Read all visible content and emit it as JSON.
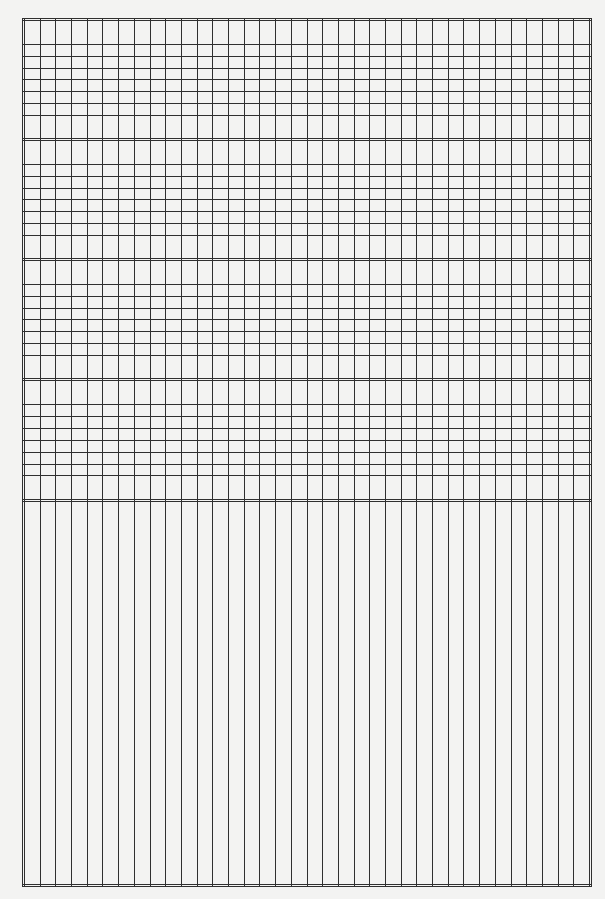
{
  "page": {
    "type": "semi-log graph paper",
    "background_color": "#f3f3f2",
    "line_color": "#2f2f2f"
  },
  "grid": {
    "left": 22,
    "right": 591,
    "top": 18,
    "bottom": 886,
    "columns": 36,
    "log_bands": [
      {
        "top": 18,
        "bottom": 139,
        "lines": [
          44,
          56,
          68,
          79,
          91,
          103,
          115
        ]
      },
      {
        "top": 139,
        "bottom": 259,
        "lines": [
          164,
          176,
          188,
          199,
          211,
          223,
          235
        ]
      },
      {
        "top": 259,
        "bottom": 379,
        "lines": [
          284,
          296,
          308,
          319,
          331,
          343,
          355
        ]
      },
      {
        "top": 379,
        "bottom": 500,
        "lines": [
          404,
          416,
          428,
          440,
          452,
          464,
          475
        ]
      }
    ],
    "linear_region": {
      "top": 500,
      "bottom": 886
    }
  }
}
